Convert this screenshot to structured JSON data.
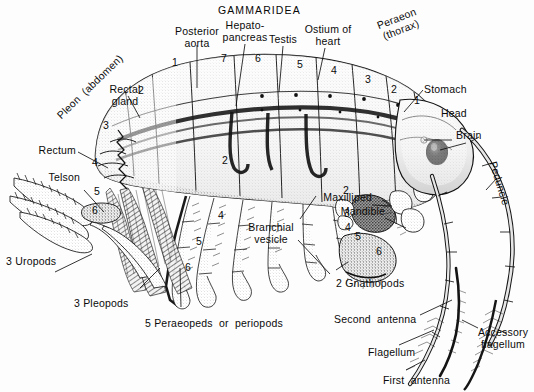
{
  "figure": {
    "title": "GAMMARIDEA",
    "style": "stipple-engraving",
    "background_color": "#fdfdfd",
    "ink_color": "#101010"
  },
  "labels": {
    "title": "GAMMARIDEA",
    "posterior_aorta": "Posterior\naorta",
    "hepatopancreas": "Hepato-\npancreas",
    "testis": "Testis",
    "ostium_of_heart": "Ostium of\nheart",
    "peraeon_thorax": "Peraeon\n(thorax)",
    "stomach": "Stomach",
    "head": "Head",
    "brain": "Brain",
    "peduncle": "Peduncle",
    "maxilliped": "Maxilliped",
    "mandible": "Mandible",
    "pleon_abdomen": "Pleon  (abdomen)",
    "rectal_gland": "Rectal\ngland",
    "rectum": "Rectum",
    "telson": "Telson",
    "uropods": "3 Uropods",
    "pleopods": "3 Pleopods",
    "peraeopeds": "5 Peraeopeds  or  periopods",
    "branchial_vesicle": "Branchial\nvesicle",
    "gnathopods": "2 Gnathopods",
    "second_antenna": "Second  antenna",
    "flagellum": "Flagellum",
    "first_antenna": "First  antenna",
    "accessory_flagellum": "Accessory\nflagellum"
  },
  "segment_numbers": {
    "pleon": [
      "1",
      "2",
      "3",
      "4",
      "5",
      "6"
    ],
    "peraeon": [
      "7",
      "6",
      "5",
      "4",
      "3",
      "2",
      "1"
    ],
    "limb_articles_left": [
      "4",
      "5",
      "6"
    ],
    "limb_articles_mid": [
      "2",
      "4",
      "5",
      "6"
    ],
    "gnathopod_articles": [
      "2",
      "3",
      "4",
      "5",
      "6"
    ]
  },
  "numbers_placed": [
    {
      "text": "1",
      "x": 172,
      "y": 57
    },
    {
      "text": "2",
      "x": 138,
      "y": 85
    },
    {
      "text": "3",
      "x": 103,
      "y": 120
    },
    {
      "text": "4",
      "x": 92,
      "y": 157
    },
    {
      "text": "5",
      "x": 94,
      "y": 186
    },
    {
      "text": "6",
      "x": 92,
      "y": 205
    },
    {
      "text": "7",
      "x": 221,
      "y": 53
    },
    {
      "text": "6",
      "x": 255,
      "y": 53
    },
    {
      "text": "5",
      "x": 297,
      "y": 59
    },
    {
      "text": "4",
      "x": 331,
      "y": 65
    },
    {
      "text": "3",
      "x": 365,
      "y": 74
    },
    {
      "text": "2",
      "x": 391,
      "y": 84
    },
    {
      "text": "1",
      "x": 414,
      "y": 95
    },
    {
      "text": "2",
      "x": 222,
      "y": 155
    },
    {
      "text": "4",
      "x": 218,
      "y": 210
    },
    {
      "text": "5",
      "x": 196,
      "y": 236
    },
    {
      "text": "6",
      "x": 185,
      "y": 262
    },
    {
      "text": "2",
      "x": 343,
      "y": 185
    },
    {
      "text": "3",
      "x": 344,
      "y": 208
    },
    {
      "text": "4",
      "x": 345,
      "y": 222
    },
    {
      "text": "5",
      "x": 355,
      "y": 231
    },
    {
      "text": "6",
      "x": 376,
      "y": 246
    }
  ]
}
